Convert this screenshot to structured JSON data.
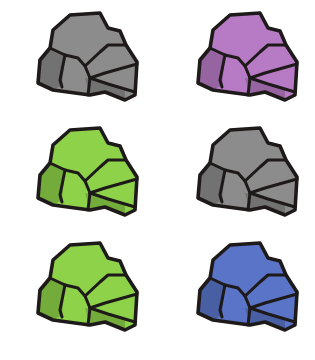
{
  "sheet": {
    "background": "#ffffff",
    "layout": {
      "columns": 2,
      "rows": 3
    }
  },
  "rocks": [
    {
      "name": "rock-gray-1",
      "color_name": "gray",
      "fill": "#8c8c8c",
      "row": 0,
      "col": 0
    },
    {
      "name": "rock-purple",
      "color_name": "purple",
      "fill": "#b77ac4",
      "row": 0,
      "col": 1
    },
    {
      "name": "rock-green-1",
      "color_name": "green",
      "fill": "#8ed24a",
      "row": 1,
      "col": 0
    },
    {
      "name": "rock-gray-2",
      "color_name": "gray",
      "fill": "#8c8c8c",
      "row": 1,
      "col": 1
    },
    {
      "name": "rock-green-2",
      "color_name": "green",
      "fill": "#8ed24a",
      "row": 2,
      "col": 0
    },
    {
      "name": "rock-blue",
      "color_name": "blue",
      "fill": "#5a74c8",
      "row": 2,
      "col": 1
    }
  ]
}
